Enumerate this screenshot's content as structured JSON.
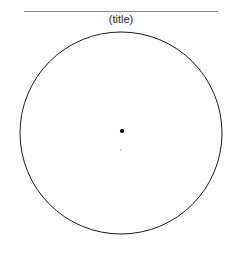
{
  "figure": {
    "width": 240,
    "height": 255,
    "background_color": "#ffffff",
    "title": "(title)",
    "title_position": {
      "x": 121,
      "y": 23
    },
    "title_font_size": 11,
    "title_color": "#2b2b2b"
  },
  "rule": {
    "name": "title-underline-rule",
    "x1": 24,
    "y1": 11,
    "x2": 218,
    "y2": 11,
    "color": "#8c8c8c",
    "stroke_width": 1
  },
  "chart_data": {
    "type": "scatter",
    "title": "(title)",
    "subtitle": "",
    "xlabel": "",
    "ylabel": "",
    "grid": false,
    "legend": null,
    "axes_visible": false,
    "tick_labels": {
      "x": [],
      "y": []
    },
    "shapes": [
      {
        "name": "outer-circle",
        "kind": "circle",
        "cx": 121,
        "cy": 133,
        "r": 101,
        "fill": "none",
        "stroke": "#1a1a1a",
        "stroke_width": 1
      }
    ],
    "points": [
      {
        "name": "center-point",
        "cx": 122,
        "cy": 131,
        "r": 2.1,
        "fill": "#0d0d0d",
        "label": ""
      },
      {
        "name": "faint-point",
        "cx": 121,
        "cy": 150,
        "r": 1.1,
        "fill": "#cfcfcf",
        "label": ""
      }
    ],
    "annotations": []
  }
}
